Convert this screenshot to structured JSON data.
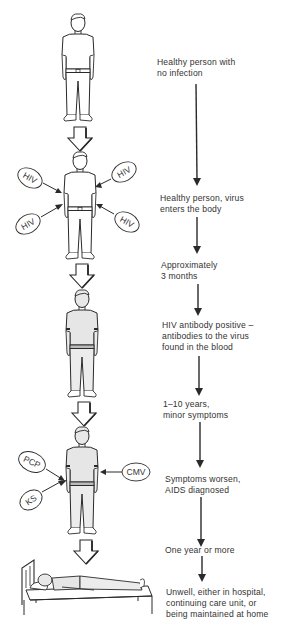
{
  "diagram": {
    "type": "progression-timeline",
    "colors": {
      "ink": "#2a2a2a",
      "background": "#ffffff",
      "shading": "#e6e6e6"
    },
    "stages": [
      {
        "id": "stage-1",
        "label": "Healthy person with\nno infection",
        "figure": "standing-person"
      },
      {
        "id": "stage-2",
        "label": "Healthy person, virus\nenters the body",
        "figure": "standing-person-hiv",
        "pathogens": [
          "HIV",
          "HIV",
          "HIV",
          "HIV"
        ]
      },
      {
        "id": "stage-3",
        "label": "Approximately\n3 months",
        "figure": "none"
      },
      {
        "id": "stage-4",
        "label": "HIV antibody positive –\nantibodies to the virus\nfound in the blood",
        "figure": "standing-person-shaded"
      },
      {
        "id": "stage-5",
        "label": "1–10 years,\nminor symptoms",
        "figure": "none"
      },
      {
        "id": "stage-6",
        "label": "Symptoms worsen,\nAIDS diagnosed",
        "figure": "standing-person-infections",
        "pathogens": [
          "PCP",
          "KS",
          "CMV"
        ]
      },
      {
        "id": "stage-7",
        "label": "One year or more",
        "figure": "none"
      },
      {
        "id": "stage-8",
        "label": "Unwell, either in hospital,\ncontinuing care unit, or\nbeing maintained at home",
        "figure": "person-in-bed"
      }
    ],
    "pathogens": {
      "hiv": [
        "HIV",
        "HIV",
        "HIV",
        "HIV"
      ],
      "infections": {
        "pcp": "PCP",
        "ks": "KS",
        "cmv": "CMV"
      }
    },
    "icons": {
      "transition": "hollow-down-arrow-icon",
      "timeline": "solid-down-arrow-icon"
    }
  }
}
